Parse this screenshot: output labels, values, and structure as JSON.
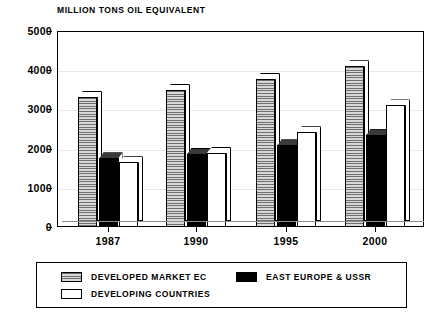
{
  "chart_data": {
    "type": "bar",
    "title": "MILLION TONS OIL EQUIVALENT",
    "xlabel": "",
    "ylabel": "",
    "ylim": [
      0,
      5000
    ],
    "yticks": [
      0,
      1000,
      2000,
      3000,
      4000,
      5000
    ],
    "ytick_labels": [
      "0",
      "1000",
      "2000",
      "3000",
      "4000",
      "5000"
    ],
    "grid": true,
    "legend_position": "bottom",
    "categories": [
      "1987",
      "1990",
      "1995",
      "2000"
    ],
    "series": [
      {
        "name": "DEVELOPED MARKET EC",
        "fill": "hatched-grey",
        "values": [
          3320,
          3500,
          3780,
          4100
        ]
      },
      {
        "name": "EAST EUROPE & USSR",
        "fill": "solid-black",
        "values": [
          1750,
          1860,
          2080,
          2340
        ]
      },
      {
        "name": "DEVELOPING COUNTRIES",
        "fill": "solid-white",
        "values": [
          1650,
          1890,
          2420,
          3100
        ]
      }
    ]
  },
  "legend": {
    "items": [
      {
        "label": "DEVELOPED MARKET EC",
        "swatch": "hatched-grey"
      },
      {
        "label": "EAST EUROPE & USSR",
        "swatch": "solid-black"
      },
      {
        "label": "DEVELOPING COUNTRIES",
        "swatch": "solid-white"
      }
    ]
  },
  "colors": {
    "axis": "#000000",
    "grid": "#e9e9e9",
    "series_grey": "#bdbdbd",
    "series_black": "#000000",
    "series_white": "#ffffff",
    "background": "#ffffff"
  }
}
